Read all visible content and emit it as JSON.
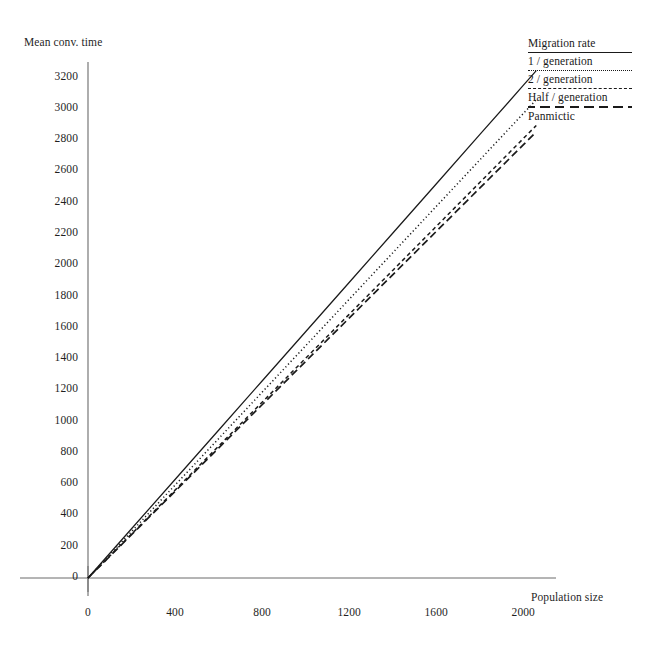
{
  "chart_data": {
    "type": "line",
    "title": "",
    "xlabel": "Population size",
    "ylabel": "Mean conv. time",
    "xlim": [
      0,
      2100
    ],
    "ylim": [
      0,
      3300
    ],
    "xticks": [
      0,
      400,
      800,
      1200,
      1600,
      2000
    ],
    "yticks": [
      0,
      200,
      400,
      600,
      800,
      1000,
      1200,
      1400,
      1600,
      1800,
      2000,
      2200,
      2400,
      2600,
      2800,
      3000,
      3200
    ],
    "grid": false,
    "legend_position": "top-right",
    "legend_title": "Migration rate",
    "series": [
      {
        "name": "1 / generation",
        "style": "solid",
        "x": [
          0,
          200,
          400,
          600,
          800,
          1000,
          1200,
          1400,
          1600,
          1800,
          2000,
          2060
        ],
        "values": [
          0,
          315,
          630,
          945,
          1260,
          1575,
          1890,
          2205,
          2520,
          2835,
          3150,
          3245
        ]
      },
      {
        "name": "2 / generation",
        "style": "dotted",
        "x": [
          0,
          200,
          400,
          600,
          800,
          1000,
          1200,
          1400,
          1600,
          1800,
          2000,
          2060
        ],
        "values": [
          0,
          297,
          594,
          891,
          1188,
          1485,
          1782,
          2079,
          2376,
          2673,
          2970,
          3059
        ]
      },
      {
        "name": "Half / generation",
        "style": "dashed-short",
        "x": [
          0,
          200,
          400,
          600,
          800,
          1000,
          1200,
          1400,
          1600,
          1800,
          2000,
          2060
        ],
        "values": [
          0,
          281,
          562,
          843,
          1124,
          1405,
          1686,
          1967,
          2248,
          2529,
          2810,
          2894
        ]
      },
      {
        "name": "Panmictic",
        "style": "dashed-long",
        "x": [
          0,
          200,
          400,
          600,
          800,
          1000,
          1200,
          1400,
          1600,
          1800,
          2000,
          2060
        ],
        "values": [
          0,
          277,
          554,
          831,
          1108,
          1385,
          1662,
          1939,
          2216,
          2493,
          2770,
          2853
        ]
      }
    ]
  },
  "axes": {
    "y_title": "Mean conv. time",
    "x_title": "Population size"
  },
  "legend": {
    "title": "Migration rate",
    "entries": [
      {
        "label": "1 / generation"
      },
      {
        "label": "2 / generation"
      },
      {
        "label": "Half / generation"
      },
      {
        "label": "Panmictic"
      }
    ]
  },
  "colors": {
    "ink": "#1a1a1a",
    "axis": "#555555",
    "background": "#ffffff"
  }
}
